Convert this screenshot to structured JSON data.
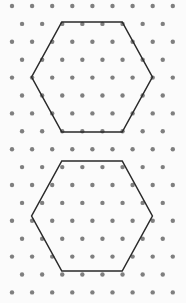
{
  "figure": {
    "width": 186,
    "height": 303,
    "background_color": "#fbfbfb"
  },
  "lattice": {
    "name": "triangular-dot-lattice",
    "dot_color": "#7f7f7f",
    "dot_radius": 2.2,
    "column_spacing": 20.1,
    "row_spacing": 17.9,
    "rows": 17,
    "dots_per_full_row": 9,
    "dots_per_offset_row": 8,
    "first_dot_x": 12,
    "first_dot_y": 6,
    "offset_x": 10.05,
    "offset_rows_start_x": 22.05,
    "description": "Alternating rows of 9 and 8 dots, offset rows shifted right by half the column spacing."
  },
  "shapes": {
    "stroke_color": "#2a2a2a",
    "stroke_width": 1.5,
    "fill": "none",
    "items": [
      {
        "name": "upper-hexagon",
        "label": "Hexagon A",
        "center_x": 92.0,
        "center_y": 77.0,
        "side_lattice_units": 3,
        "points": "61.8,22.0 122.2,22.0 152.4,77.0 122.2,132.0 61.8,132.0 31.6,77.0",
        "vertices": [
          {
            "x": 61.8,
            "y": 22.0
          },
          {
            "x": 122.2,
            "y": 22.0
          },
          {
            "x": 152.4,
            "y": 77.0
          },
          {
            "x": 122.2,
            "y": 132.0
          },
          {
            "x": 61.8,
            "y": 132.0
          },
          {
            "x": 31.6,
            "y": 77.0
          }
        ]
      },
      {
        "name": "lower-hexagon",
        "label": "Hexagon B",
        "center_x": 92.0,
        "center_y": 216.0,
        "side_lattice_units": 3,
        "points": "61.8,161.0 122.2,161.0 152.4,216.0 122.2,271.0 61.8,271.0 31.6,216.0",
        "vertices": [
          {
            "x": 61.8,
            "y": 161.0
          },
          {
            "x": 122.2,
            "y": 161.0
          },
          {
            "x": 152.4,
            "y": 216.0
          },
          {
            "x": 122.2,
            "y": 271.0
          },
          {
            "x": 61.8,
            "y": 271.0
          },
          {
            "x": 31.6,
            "y": 216.0
          }
        ]
      }
    ]
  }
}
